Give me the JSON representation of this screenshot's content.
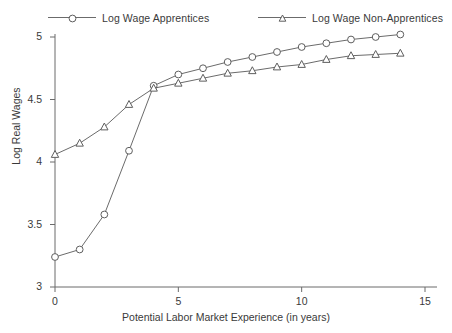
{
  "chart_data": {
    "type": "line",
    "title": "",
    "xlabel": "Potential Labor Market Experience (in years)",
    "ylabel": "Log Real Wages",
    "xlim": [
      -0.6,
      15.6
    ],
    "ylim": [
      2.88,
      5.12
    ],
    "xticks": [
      0,
      5,
      10,
      15
    ],
    "yticks": [
      3,
      3.5,
      4,
      4.5,
      5
    ],
    "xtick_labels": [
      "0",
      "5",
      "10",
      "15"
    ],
    "ytick_labels": [
      "3",
      "3.5",
      "4",
      "4.5",
      "5"
    ],
    "grid": false,
    "legend_position": "top",
    "x": [
      0,
      1,
      2,
      3,
      4,
      5,
      6,
      7,
      8,
      9,
      10,
      11,
      12,
      13,
      14
    ],
    "series": [
      {
        "name": "Log Wage Apprentices",
        "marker": "circle",
        "values": [
          3.24,
          3.3,
          3.58,
          4.09,
          4.61,
          4.7,
          4.75,
          4.8,
          4.84,
          4.88,
          4.92,
          4.95,
          4.98,
          5.0,
          5.02
        ]
      },
      {
        "name": "Log Wage Non-Apprentices",
        "marker": "triangle",
        "values": [
          4.06,
          4.15,
          4.28,
          4.46,
          4.59,
          4.63,
          4.67,
          4.71,
          4.73,
          4.76,
          4.78,
          4.82,
          4.85,
          4.86,
          4.87
        ]
      }
    ]
  },
  "legend": {
    "entries": [
      {
        "label": "Log Wage Apprentices",
        "marker": "circle-marker-icon"
      },
      {
        "label": "Log Wage Non-Apprentices",
        "marker": "triangle-marker-icon"
      }
    ]
  },
  "axes": {
    "x_title": "Potential Labor Market Experience (in years)",
    "y_title": "Log Real Wages"
  },
  "colors": {
    "line": "#6b6b6b",
    "marker_stroke": "#5e5e5e",
    "marker_fill": "#ffffff",
    "text": "#3a3a3a",
    "background": "#ffffff"
  }
}
